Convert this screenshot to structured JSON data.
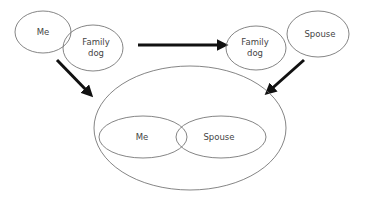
{
  "diagram": {
    "nodes": {
      "top_left_me": {
        "label": "Me"
      },
      "top_left_dog": {
        "line1": "Family",
        "line2": "dog"
      },
      "top_right_dog": {
        "line1": "Family",
        "line2": "dog"
      },
      "top_right_spouse": {
        "label": "Spouse"
      },
      "bottom_me": {
        "label": "Me"
      },
      "bottom_spouse": {
        "label": "Spouse"
      }
    },
    "edges": [
      {
        "from": "top-left-group",
        "to": "top-right-group",
        "style": "bold-arrow"
      },
      {
        "from": "top-left-group",
        "to": "bottom-group",
        "style": "bold-arrow"
      },
      {
        "from": "top-right-group",
        "to": "bottom-group",
        "style": "bold-arrow"
      }
    ],
    "colors": {
      "stroke": "#666666",
      "arrow": "#111111",
      "text": "#444444",
      "background": "#ffffff"
    }
  }
}
